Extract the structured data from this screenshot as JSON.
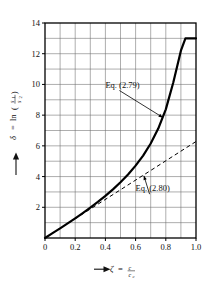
{
  "chart_data": {
    "type": "line",
    "title": "",
    "xlabel": "ζ = c/c_c",
    "ylabel": "δ = ln(s₁/s₂)",
    "xlim": [
      0,
      1.0
    ],
    "ylim": [
      0,
      14
    ],
    "grid": true,
    "grid_x_step": 0.1,
    "grid_y_step": 1,
    "x_ticks": [
      "0",
      "0.2",
      "0.4",
      "0.6",
      "0.8",
      "1.0"
    ],
    "x_tick_values": [
      0,
      0.2,
      0.4,
      0.6,
      0.8,
      1.0
    ],
    "y_ticks": [
      "2",
      "4",
      "6",
      "8",
      "10",
      "12",
      "14"
    ],
    "y_tick_values": [
      2,
      4,
      6,
      8,
      10,
      12,
      14
    ],
    "legend_position": "inline-annotations",
    "series": [
      {
        "name": "Eq. (2.79)",
        "style": "solid",
        "linewidth": 2.2,
        "color": "#000000",
        "x": [
          0,
          0.05,
          0.1,
          0.15,
          0.2,
          0.25,
          0.3,
          0.35,
          0.4,
          0.45,
          0.5,
          0.55,
          0.6,
          0.65,
          0.7,
          0.75,
          0.8,
          0.85,
          0.9,
          0.93,
          0.95,
          0.97,
          0.99,
          1.0
        ],
        "values": [
          0,
          0.315,
          0.631,
          0.953,
          1.282,
          1.622,
          1.976,
          2.347,
          2.742,
          3.165,
          3.628,
          4.14,
          4.712,
          5.368,
          6.156,
          7.123,
          8.378,
          10.14,
          12.2,
          13.0,
          13.0,
          13.0,
          13.0,
          13.0
        ]
      },
      {
        "name": "Eq. (2.80)",
        "style": "dashed",
        "linewidth": 1.0,
        "color": "#000000",
        "x": [
          0,
          1.0
        ],
        "values": [
          0,
          6.283
        ]
      }
    ],
    "annotations": [
      {
        "text": "Eq. (2.79)",
        "label_x": 0.4,
        "label_y": 9.8,
        "point_x": 0.78,
        "point_y": 7.85
      },
      {
        "text": "Eq. (2.80)",
        "label_x": 0.6,
        "label_y": 3.05,
        "point_x": 0.655,
        "point_y": 4.05
      }
    ]
  },
  "axis": {
    "y_label_delta": "δ",
    "y_label_eq": "=",
    "y_label_ln": "ln",
    "y_label_num": "s",
    "y_label_num_sub": "1",
    "y_label_den": "s",
    "y_label_den_sub": "2",
    "y_arrow": "arrow-up-icon",
    "x_label_zeta": "ζ",
    "x_label_eq": "=",
    "x_label_num": "c",
    "x_label_den": "c",
    "x_label_den_sub": "c",
    "x_arrow": "arrow-right-icon"
  }
}
